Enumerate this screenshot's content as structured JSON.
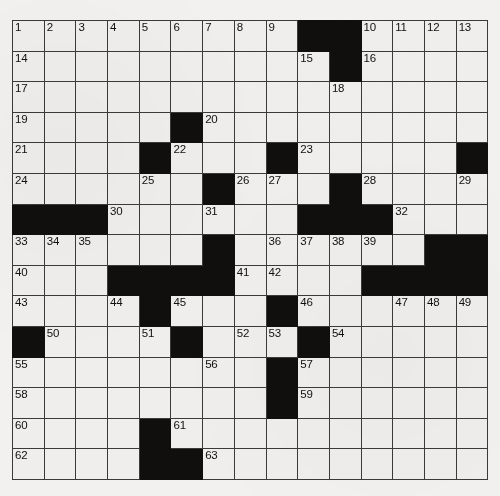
{
  "puzzle": {
    "type": "crossword-grid",
    "rows": 15,
    "cols": 15,
    "cell_size_px": 31.7,
    "colors": {
      "paper": "#f1f0ee",
      "cell_fill": "#efeeec",
      "block_fill": "#100f0d",
      "grid_line": "#3a3a38",
      "number_text": "#111010"
    },
    "blocks": [
      [
        0,
        9
      ],
      [
        0,
        10
      ],
      [
        1,
        10
      ],
      [
        3,
        5
      ],
      [
        4,
        4
      ],
      [
        4,
        8
      ],
      [
        4,
        14
      ],
      [
        5,
        6
      ],
      [
        5,
        10
      ],
      [
        6,
        0
      ],
      [
        6,
        1
      ],
      [
        6,
        2
      ],
      [
        6,
        9
      ],
      [
        6,
        10
      ],
      [
        6,
        11
      ],
      [
        7,
        6
      ],
      [
        7,
        13
      ],
      [
        7,
        14
      ],
      [
        8,
        3
      ],
      [
        8,
        4
      ],
      [
        8,
        5
      ],
      [
        8,
        6
      ],
      [
        8,
        11
      ],
      [
        8,
        12
      ],
      [
        8,
        13
      ],
      [
        8,
        14
      ],
      [
        9,
        4
      ],
      [
        9,
        8
      ],
      [
        10,
        0
      ],
      [
        10,
        5
      ],
      [
        10,
        9
      ],
      [
        11,
        8
      ],
      [
        12,
        8
      ],
      [
        13,
        4
      ],
      [
        14,
        4
      ],
      [
        14,
        5
      ]
    ],
    "numbers": [
      {
        "r": 0,
        "c": 0,
        "n": "1"
      },
      {
        "r": 0,
        "c": 1,
        "n": "2"
      },
      {
        "r": 0,
        "c": 2,
        "n": "3"
      },
      {
        "r": 0,
        "c": 3,
        "n": "4"
      },
      {
        "r": 0,
        "c": 4,
        "n": "5"
      },
      {
        "r": 0,
        "c": 5,
        "n": "6"
      },
      {
        "r": 0,
        "c": 6,
        "n": "7"
      },
      {
        "r": 0,
        "c": 7,
        "n": "8"
      },
      {
        "r": 0,
        "c": 8,
        "n": "9"
      },
      {
        "r": 0,
        "c": 11,
        "n": "10"
      },
      {
        "r": 0,
        "c": 12,
        "n": "11"
      },
      {
        "r": 0,
        "c": 13,
        "n": "12"
      },
      {
        "r": 0,
        "c": 14,
        "n": "13"
      },
      {
        "r": 1,
        "c": 0,
        "n": "14"
      },
      {
        "r": 1,
        "c": 9,
        "n": "15"
      },
      {
        "r": 1,
        "c": 11,
        "n": "16"
      },
      {
        "r": 2,
        "c": 0,
        "n": "17"
      },
      {
        "r": 2,
        "c": 10,
        "n": "18"
      },
      {
        "r": 3,
        "c": 0,
        "n": "19"
      },
      {
        "r": 3,
        "c": 6,
        "n": "20"
      },
      {
        "r": 4,
        "c": 0,
        "n": "21"
      },
      {
        "r": 4,
        "c": 5,
        "n": "22"
      },
      {
        "r": 4,
        "c": 9,
        "n": "23"
      },
      {
        "r": 5,
        "c": 0,
        "n": "24"
      },
      {
        "r": 5,
        "c": 4,
        "n": "25"
      },
      {
        "r": 5,
        "c": 7,
        "n": "26"
      },
      {
        "r": 5,
        "c": 8,
        "n": "27"
      },
      {
        "r": 5,
        "c": 11,
        "n": "28"
      },
      {
        "r": 5,
        "c": 14,
        "n": "29"
      },
      {
        "r": 6,
        "c": 3,
        "n": "30"
      },
      {
        "r": 6,
        "c": 6,
        "n": "31"
      },
      {
        "r": 6,
        "c": 12,
        "n": "32"
      },
      {
        "r": 7,
        "c": 0,
        "n": "33"
      },
      {
        "r": 7,
        "c": 1,
        "n": "34"
      },
      {
        "r": 7,
        "c": 2,
        "n": "35"
      },
      {
        "r": 7,
        "c": 8,
        "n": "36"
      },
      {
        "r": 7,
        "c": 9,
        "n": "37"
      },
      {
        "r": 7,
        "c": 10,
        "n": "38"
      },
      {
        "r": 7,
        "c": 11,
        "n": "39"
      },
      {
        "r": 8,
        "c": 0,
        "n": "40"
      },
      {
        "r": 8,
        "c": 7,
        "n": "41"
      },
      {
        "r": 8,
        "c": 8,
        "n": "42"
      },
      {
        "r": 9,
        "c": 0,
        "n": "43"
      },
      {
        "r": 9,
        "c": 3,
        "n": "44"
      },
      {
        "r": 9,
        "c": 5,
        "n": "45"
      },
      {
        "r": 9,
        "c": 9,
        "n": "46"
      },
      {
        "r": 9,
        "c": 12,
        "n": "47"
      },
      {
        "r": 9,
        "c": 13,
        "n": "48"
      },
      {
        "r": 9,
        "c": 14,
        "n": "49"
      },
      {
        "r": 10,
        "c": 1,
        "n": "50"
      },
      {
        "r": 10,
        "c": 4,
        "n": "51"
      },
      {
        "r": 10,
        "c": 7,
        "n": "52"
      },
      {
        "r": 10,
        "c": 8,
        "n": "53"
      },
      {
        "r": 10,
        "c": 10,
        "n": "54"
      },
      {
        "r": 11,
        "c": 0,
        "n": "55"
      },
      {
        "r": 11,
        "c": 6,
        "n": "56"
      },
      {
        "r": 11,
        "c": 9,
        "n": "57"
      },
      {
        "r": 12,
        "c": 0,
        "n": "58"
      },
      {
        "r": 12,
        "c": 9,
        "n": "59"
      },
      {
        "r": 13,
        "c": 0,
        "n": "60"
      },
      {
        "r": 13,
        "c": 5,
        "n": "61"
      },
      {
        "r": 14,
        "c": 0,
        "n": "62"
      },
      {
        "r": 14,
        "c": 6,
        "n": "63"
      }
    ]
  }
}
